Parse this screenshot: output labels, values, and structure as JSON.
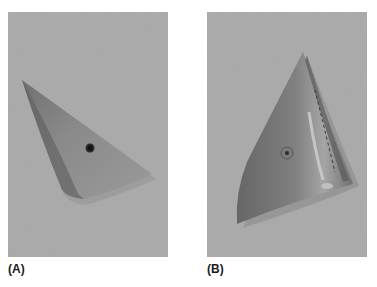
{
  "figure": {
    "panels": [
      {
        "id": "A",
        "label": "(A)",
        "description": "Triangular plastic wedge-shaped part photographed on grey background, with a single dark hole near its center",
        "background_color": "#a9a9a9",
        "object_color": "#8e8e8e"
      },
      {
        "id": "B",
        "label": "(B)",
        "description": "Curved triangular plastic shell part with a central screw boss and a ridged edge, photographed on grey background",
        "background_color": "#a9a9a9",
        "object_color": "#7f7f7f"
      }
    ]
  }
}
